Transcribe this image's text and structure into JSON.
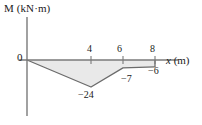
{
  "chart_data": {
    "type": "area",
    "title": "",
    "xlabel": "x (m)",
    "ylabel": "M (kN·m)",
    "x_axis_label_text": "x",
    "x_axis_unit_text": " (m)",
    "origin_label": "0",
    "xlim": [
      0,
      9
    ],
    "ylim": [
      -28,
      4
    ],
    "grid": false,
    "legend": null,
    "x_ticks": [
      {
        "value": 4,
        "label": "4"
      },
      {
        "value": 6,
        "label": "6"
      },
      {
        "value": 8,
        "label": "8"
      }
    ],
    "y_ticks": [],
    "x": [
      0,
      4,
      6,
      8
    ],
    "values": [
      0,
      -24,
      -7,
      -6
    ],
    "series": [
      {
        "name": "Bending moment M",
        "x": [
          0,
          4,
          6,
          8
        ],
        "values": [
          0,
          -24,
          -7,
          -6
        ]
      }
    ],
    "point_labels": [
      {
        "x": 4,
        "y": -24,
        "text": "−24"
      },
      {
        "x": 6,
        "y": -7,
        "text": "−7"
      },
      {
        "x": 8,
        "y": -6,
        "text": "−6"
      }
    ],
    "fill_color": "#e9e9e9",
    "line_color": "#6b6b6b",
    "axis_color": "#7a7a7a",
    "background_color": "#ffffff"
  }
}
